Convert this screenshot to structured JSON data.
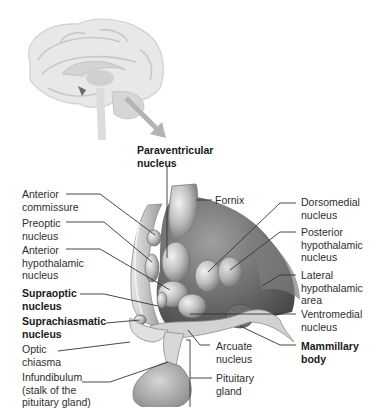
{
  "diagram": {
    "type": "anatomical illustration",
    "inset": "Sagittal brain view with arrow pointing to hypothalamus region",
    "colors": {
      "background": "#ffffff",
      "label_text": "#2e2e2e",
      "leader_line": "#333333",
      "tissue_light": "#d9d9d9",
      "tissue_mid": "#a8a8a8",
      "tissue_dark": "#5a5a5a"
    }
  },
  "labels": {
    "paraventricular": "Paraventricular\nnucleus",
    "anterior_commissure": "Anterior\ncommissure",
    "preoptic": "Preoptic\nnucleus",
    "anterior_hypothalamic": "Anterior\nhypothalamic\nnucleus",
    "supraoptic": "Supraoptic\nnucleus",
    "suprachiasmatic": "Suprachiasmatic\nnucleus",
    "optic_chiasma": "Optic\nchiasma",
    "infundibulum": "Infundibulum\n(stalk of the\npituitary gland)",
    "fornix": "Fornix",
    "dorsomedial": "Dorsomedial\nnucleus",
    "posterior_hypothalamic": "Posterior\nhypothalamic\nnucleus",
    "lateral_hypothalamic": "Lateral\nhypothalamic\narea",
    "ventromedial": "Ventromedial\nnucleus",
    "mammillary": "Mammillary\nbody",
    "arcuate": "Arcuate\nnucleus",
    "pituitary": "Pituitary\ngland"
  }
}
